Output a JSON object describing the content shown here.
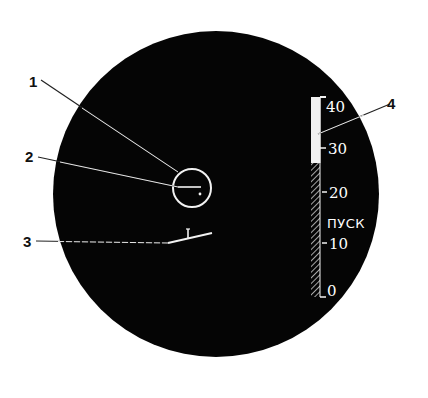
{
  "diagram": {
    "type": "sight-display",
    "colors": {
      "screen": "#050505",
      "symbols": "#f2f2f2",
      "background": "#ffffff",
      "callout_line": "#222222"
    },
    "callouts": [
      {
        "id": "1",
        "label": "1",
        "target": "reticle-circle"
      },
      {
        "id": "2",
        "label": "2",
        "target": "reticle-center-mark"
      },
      {
        "id": "3",
        "label": "3",
        "target": "horizon-marker"
      },
      {
        "id": "4",
        "label": "4",
        "target": "range-scale-bar"
      }
    ],
    "scale": {
      "ticks": [
        {
          "value": "40",
          "label": "40"
        },
        {
          "value": "30",
          "label": "30"
        },
        {
          "value": "20",
          "label": "20"
        },
        {
          "value": "10",
          "label": "10"
        },
        {
          "value": "0",
          "label": "0"
        }
      ],
      "launch_label": "ПУСК",
      "filled_range": [
        30,
        40
      ],
      "hatched_range": [
        0,
        30
      ]
    }
  }
}
